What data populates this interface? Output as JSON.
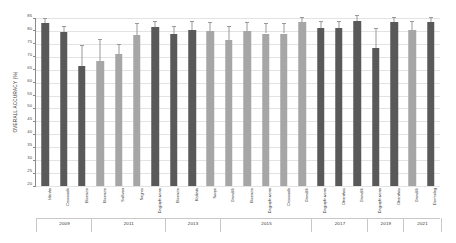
{
  "chart_data": {
    "type": "bar",
    "title": "",
    "xlabel": "",
    "ylabel": "OVERALL ACCURACY (%)",
    "ylim": [
      20,
      85
    ],
    "ytick_labels": [
      "85",
      "80",
      "75",
      "70",
      "65",
      "60",
      "55",
      "50",
      "45",
      "40",
      "35",
      "30",
      "25",
      "20"
    ],
    "ytick_values": [
      85,
      80,
      75,
      70,
      65,
      60,
      55,
      50,
      45,
      40,
      35,
      30,
      25,
      20
    ],
    "grid": true,
    "legend": "none",
    "categories": [
      "Idanha",
      "Crosswalk",
      "Bisenzio",
      "Bisenzio",
      "Sullivan",
      "Sagres",
      "Dagiupfruvona",
      "Bisenzio",
      "Kalkata",
      "Swipe",
      "Grondilli",
      "Bisenzio",
      "Dagiupfruvona",
      "Crosswalk",
      "Grondilli",
      "Dagiupfruvona",
      "Otranthos",
      "Grondilli",
      "Dagiupfruvona",
      "Otranthos",
      "Grondilli",
      "Dermolog"
    ],
    "values": [
      83.0,
      79.5,
      66.5,
      68.5,
      71.0,
      78.5,
      81.5,
      79.0,
      80.5,
      80.0,
      76.5,
      80.0,
      79.0,
      79.0,
      83.5,
      81.0,
      81.0,
      84.0,
      73.5,
      83.5,
      80.5,
      83.5
    ],
    "error_upper": [
      85.0,
      82.0,
      74.5,
      77.0,
      75.0,
      83.0,
      84.0,
      82.0,
      84.0,
      83.5,
      82.0,
      83.5,
      83.0,
      83.0,
      85.5,
      84.0,
      84.0,
      86.0,
      81.0,
      85.5,
      84.0,
      85.5
    ],
    "bar_colors": [
      "#595959",
      "#595959",
      "#595959",
      "#a6a6a6",
      "#a6a6a6",
      "#a6a6a6",
      "#595959",
      "#595959",
      "#595959",
      "#a6a6a6",
      "#a6a6a6",
      "#a6a6a6",
      "#a6a6a6",
      "#a6a6a6",
      "#a6a6a6",
      "#595959",
      "#595959",
      "#595959",
      "#595959",
      "#595959",
      "#a6a6a6",
      "#595959"
    ],
    "year_groups": [
      {
        "label": "2009",
        "count": 3
      },
      {
        "label": "2011",
        "count": 4
      },
      {
        "label": "2013",
        "count": 3
      },
      {
        "label": "2015",
        "count": 5
      },
      {
        "label": "2017",
        "count": 3
      },
      {
        "label": "2019",
        "count": 2
      },
      {
        "label": "2021",
        "count": 2
      }
    ],
    "colors": {
      "bar_dark": "#595959",
      "bar_light": "#a6a6a6",
      "grid": "#e3e3e3",
      "axis": "#8a8a8a",
      "error_bar": "#9a9a9a",
      "text": "#2f2f2f",
      "background": "#ffffff"
    }
  }
}
